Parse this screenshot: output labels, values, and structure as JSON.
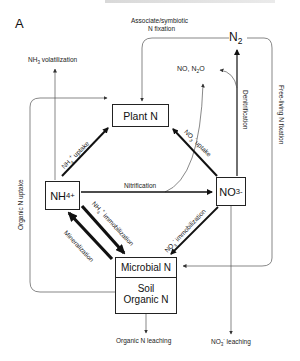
{
  "panel_label": "A",
  "running_header": "(clipped page header, illegible)",
  "nodes": {
    "plant_n": "Plant N",
    "nh4": {
      "base": "NH",
      "sub": "4",
      "sup": "+"
    },
    "no3": {
      "base": "NO",
      "sub": "3",
      "sup": "-"
    },
    "microbial_n": "Microbial N",
    "soil_organic_n_line1": "Soil",
    "soil_organic_n_line2": "Organic N",
    "n2": {
      "base": "N",
      "sub": "2"
    }
  },
  "labels": {
    "assoc_fix_line1": "Associate/symbiotic",
    "assoc_fix_line2": "N fixation",
    "nh3_vol": {
      "base": "NH",
      "sub": "3",
      "rest": " volatilization"
    },
    "no_n2o": {
      "pre": "NO, N",
      "sub": "2",
      "post": "O"
    },
    "denitrification": "Denitrification",
    "free_living": "Free-living N fixation",
    "organic_n_uptake": "Organic N uptake",
    "nh4_uptake": {
      "pre": "NH",
      "sub": "4",
      "sup": "+",
      "post": " uptake"
    },
    "no3_uptake": {
      "pre": "NO",
      "sub": "3",
      "sup": "-",
      "post": " uptake"
    },
    "nitrification": "Nitrification",
    "nh4_immob": {
      "pre": "NH",
      "sub": "4",
      "sup": "+",
      "post": " immobilization"
    },
    "no3_immob": {
      "pre": "NO",
      "sub": "3",
      "sup": "-",
      "post": " immobilization"
    },
    "mineralization": "Mineralization",
    "organic_n_leaching": "Organic N leaching",
    "no3_leaching": {
      "pre": "NO",
      "sub": "3",
      "sup": "-",
      "post": " leaching"
    }
  }
}
